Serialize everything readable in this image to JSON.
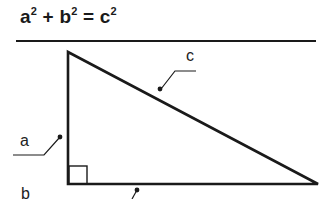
{
  "title": {
    "term_a": "a",
    "term_b": "b",
    "term_c": "c",
    "exponent": "2",
    "plus": "+",
    "equals": "="
  },
  "labels": {
    "side_a": "a",
    "side_b": "b",
    "side_c": "c"
  },
  "colors": {
    "stroke": "#1a1a1a",
    "text": "#222222",
    "background": "#ffffff"
  }
}
